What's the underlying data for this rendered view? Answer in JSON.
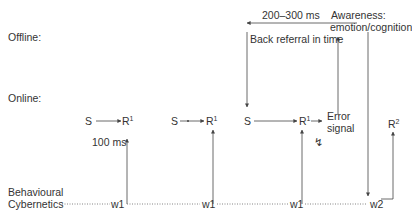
{
  "rows": {
    "offline": "Offline:",
    "online": "Online:",
    "behavioural_line1": "Behavioural",
    "behavioural_line2": "Cybernetics"
  },
  "top": {
    "timing": "200–300 ms",
    "back_referral": "Back referral in time",
    "awareness_line1": "Awareness:",
    "awareness_line2": "emotion/cognition"
  },
  "online_nodes": {
    "s1": "S",
    "r1_1": "R",
    "r1_1_sup": "1",
    "s2": "S",
    "r1_2": "R",
    "r1_2_sup": "1",
    "s3": "S",
    "r1_3": "R",
    "r1_3_sup": "1",
    "error_line1": "Error",
    "error_line2": "signal",
    "r2": "R",
    "r2_sup": "2",
    "latency": "100 ms",
    "lightning": "↯"
  },
  "baseline": {
    "w_labels": [
      "w1",
      "w1",
      "w1",
      "w2"
    ]
  },
  "colors": {
    "line": "#444444",
    "text": "#333333",
    "dotted": "#666666"
  }
}
